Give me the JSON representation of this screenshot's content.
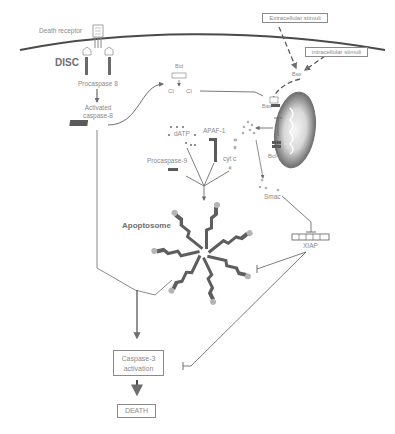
{
  "diagram": {
    "colors": {
      "line": "#6e6e6e",
      "text": "#8a8a8a",
      "protein": "#6a6a6a",
      "mitochondrion_outer": "#7a7a7a",
      "mitochondrion_inner": "#f4f4f4",
      "background": "#ffffff"
    },
    "extrinsic": {
      "death_receptor": "Death receptor",
      "disc": "DISC",
      "procaspase8": "Procaspase 8",
      "activated_caspase8_line1": "Activated",
      "activated_caspase8_line2": "caspase-8"
    },
    "stimuli": {
      "extracellular": "Extracellular stimuli",
      "intracellular": "intracellular stimuli"
    },
    "bid": {
      "label": "Bid",
      "tbid_left": "CI",
      "tbid_right": "CI"
    },
    "mitochondria": {
      "bax_cytosol": "Bax",
      "bax_membrane": "Bax",
      "bcl2": "Bcl-2"
    },
    "apoptosome_inputs": {
      "datp": "dATP",
      "apaf1": "APAF-1",
      "procaspase9": "Procaspase-9",
      "cytc": "cyt c"
    },
    "apoptosome": {
      "label": "Apoptosome",
      "arm_count": 7
    },
    "smac": "Smac",
    "xiap": "XIAP",
    "outcome": {
      "caspase3_line1": "Caspase-3",
      "caspase3_line2": "activation",
      "death": "DEATH"
    },
    "edges": [
      {
        "from": "Death receptor",
        "to": "Procaspase 8",
        "type": "activation"
      },
      {
        "from": "Procaspase 8",
        "to": "Activated caspase-8",
        "type": "activation"
      },
      {
        "from": "Activated caspase-8",
        "to": "Bid",
        "type": "activation"
      },
      {
        "from": "Bid",
        "to": "tBid",
        "type": "cleavage"
      },
      {
        "from": "tBid",
        "to": "Bax",
        "type": "activation"
      },
      {
        "from": "Extracellular stimuli",
        "to": "Bax",
        "type": "dashed"
      },
      {
        "from": "intracellular stimuli",
        "to": "Bax",
        "type": "dashed"
      },
      {
        "from": "Bax",
        "to": "Mitochondrion",
        "type": "dashed"
      },
      {
        "from": "Bcl-2",
        "to": "Bax",
        "type": "inhibition"
      },
      {
        "from": "Mitochondrion",
        "to": "cyt c",
        "type": "release"
      },
      {
        "from": "Mitochondrion",
        "to": "Smac",
        "type": "release"
      },
      {
        "from": "dATP/APAF-1/Procaspase-9/cyt c",
        "to": "Apoptosome",
        "type": "assembly"
      },
      {
        "from": "Smac",
        "to": "XIAP",
        "type": "inhibition"
      },
      {
        "from": "XIAP",
        "to": "Apoptosome",
        "type": "inhibition"
      },
      {
        "from": "XIAP",
        "to": "Caspase-3 activation",
        "type": "inhibition"
      },
      {
        "from": "Activated caspase-8",
        "to": "Caspase-3 activation",
        "type": "activation"
      },
      {
        "from": "Apoptosome",
        "to": "Caspase-3 activation",
        "type": "activation"
      },
      {
        "from": "Caspase-3 activation",
        "to": "DEATH",
        "type": "activation"
      }
    ]
  }
}
